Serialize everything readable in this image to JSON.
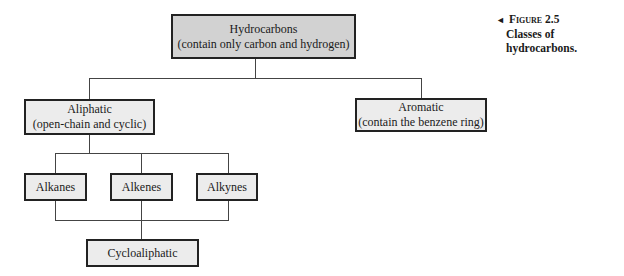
{
  "figure": {
    "label": "Figure 2.5",
    "caption": "Classes of hydrocarbons.",
    "arrow_icon": "◄"
  },
  "nodes": {
    "root": {
      "title": "Hydrocarbons",
      "subtitle": "(contain only carbon and hydrogen)"
    },
    "aliphatic": {
      "title": "Aliphatic",
      "subtitle": "(open-chain and cyclic)"
    },
    "aromatic": {
      "title": "Aromatic",
      "subtitle": "(contain the benzene ring)"
    },
    "alkanes": {
      "title": "Alkanes"
    },
    "alkenes": {
      "title": "Alkenes"
    },
    "alkynes": {
      "title": "Alkynes"
    },
    "cycloaliphatic": {
      "title": "Cycloaliphatic"
    }
  }
}
